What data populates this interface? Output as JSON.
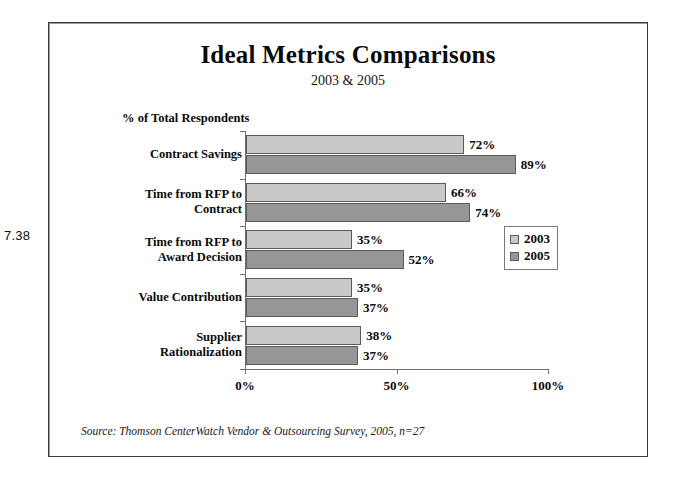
{
  "figure_number": "7.38",
  "chart_data": {
    "type": "bar",
    "orientation": "horizontal",
    "title": "Ideal Metrics Comparisons",
    "subtitle": "2003 & 2005",
    "xlabel": "",
    "ylabel": "",
    "axis_header": "% of Total Respondents",
    "categories": [
      "Contract Savings",
      "Time from RFP to Contract",
      "Time from RFP to Award Decision",
      "Value Contribution",
      "Supplier Rationalization"
    ],
    "category_lines": [
      [
        "Contract Savings"
      ],
      [
        "Time from RFP to",
        "Contract"
      ],
      [
        "Time from RFP to",
        "Award Decision"
      ],
      [
        "Value Contribution"
      ],
      [
        "Supplier",
        "Rationalization"
      ]
    ],
    "series": [
      {
        "name": "2003",
        "color": "#c9c9c9",
        "values": [
          72,
          66,
          35,
          35,
          38
        ],
        "labels": [
          "72%",
          "66%",
          "35%",
          "35%",
          "38%"
        ]
      },
      {
        "name": "2005",
        "color": "#969696",
        "values": [
          89,
          74,
          52,
          37,
          37
        ],
        "labels": [
          "89%",
          "74%",
          "52%",
          "37%",
          "37%"
        ]
      }
    ],
    "xlim": [
      0,
      100
    ],
    "xticks": [
      0,
      50,
      100
    ],
    "xtick_labels": [
      "0%",
      "50%",
      "100%"
    ],
    "grid": false,
    "legend_position": "middle-right",
    "legend_entries": [
      "2003",
      "2005"
    ]
  },
  "source_note": "Source: Thomson CenterWatch Vendor & Outsourcing Survey, 2005, n=27"
}
